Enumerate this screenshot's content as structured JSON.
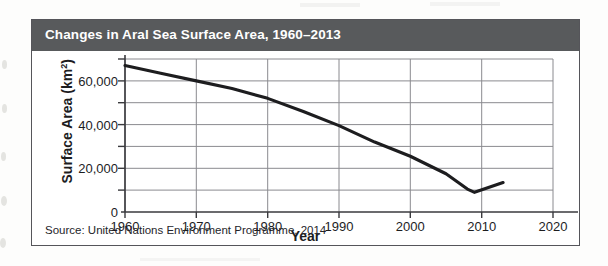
{
  "figure": {
    "title": "Changes in Aral Sea Surface Area, 1960–2013",
    "source": "Source: United Nations Environment Programme, 2014",
    "title_bar_color": "#585a5c",
    "title_text_color": "#ffffff",
    "border_color": "#55555a",
    "background_color": "#ffffff"
  },
  "chart_data": {
    "type": "line",
    "title": "Changes in Aral Sea Surface Area, 1960–2013",
    "xlabel": "Year",
    "ylabel": "Surface Area (km²)",
    "xlim": [
      1960,
      2020
    ],
    "ylim": [
      0,
      70000
    ],
    "xticks": [
      1960,
      1970,
      1980,
      1990,
      2000,
      2010,
      2020
    ],
    "xtick_labels": [
      "1960",
      "1970",
      "1980",
      "1990",
      "2000",
      "2010",
      "2020"
    ],
    "yticks": [
      0,
      20000,
      40000,
      60000
    ],
    "ytick_labels": [
      "0",
      "20,000",
      "40,000",
      "60,000"
    ],
    "y_gridlines": [
      0,
      10000,
      20000,
      30000,
      40000,
      50000,
      60000,
      70000
    ],
    "x_gridlines": [
      1960,
      1970,
      1980,
      1990,
      2000,
      2010
    ],
    "grid": true,
    "legend": false,
    "line_color": "#1d1d1f",
    "grid_color": "#8a8a8f",
    "series": [
      {
        "name": "Aral Sea surface area",
        "x": [
          1960,
          1965,
          1970,
          1975,
          1980,
          1985,
          1990,
          1995,
          2000,
          2005,
          2008,
          2009,
          2013
        ],
        "values": [
          67000,
          63500,
          60000,
          56500,
          52000,
          46000,
          39500,
          32000,
          25500,
          17500,
          10500,
          9000,
          13500
        ]
      }
    ],
    "units": "km²",
    "annotations": []
  },
  "axis": {
    "ytick_values": [
      "60,000",
      "40,000",
      "20,000",
      "0"
    ],
    "xtick_values": [
      "1960",
      "1970",
      "1980",
      "1990",
      "2000",
      "2010",
      "2020"
    ],
    "y_title_main": "Surface Area (km",
    "y_title_sup": "2",
    "y_title_end": ")",
    "x_title": "Year"
  }
}
